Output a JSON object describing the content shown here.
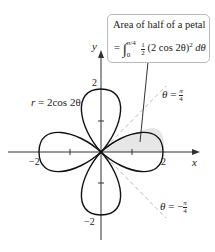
{
  "figure": {
    "curve_label_lhs": "r",
    "curve_label_rhs": "= 2cos 2θ",
    "axes": {
      "x_label": "x",
      "y_label": "y"
    },
    "ticks": {
      "x_pos": "2",
      "x_neg": "−2",
      "y_pos": "2",
      "y_neg": "−2"
    },
    "lines": {
      "upper": {
        "lhs": "θ",
        "rhs": "=",
        "num": "π",
        "den": "4"
      },
      "lower": {
        "lhs": "θ",
        "rhs": "= −",
        "num": "π",
        "den": "4"
      }
    },
    "callout": {
      "title": "Area of half of a petal",
      "eq_prefix": "=",
      "upper_limit": "π/4",
      "lower_limit": "0",
      "half_num": "1",
      "half_den": "2",
      "integrand": "(2 cos 2θ)",
      "power": "2",
      "differential": "dθ"
    },
    "colors": {
      "curve": "#111111",
      "shade": "#e6e6e6",
      "dashed": "#bbbbbb",
      "callout_border": "#bbbbbb"
    }
  }
}
